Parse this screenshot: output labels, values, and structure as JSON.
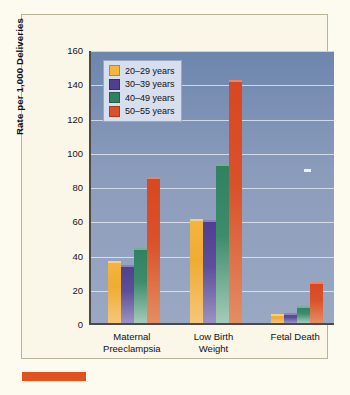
{
  "chart_data": {
    "type": "bar",
    "title": "",
    "xlabel": "",
    "ylabel": "Rate per 1,000 Deliveries",
    "ylim": [
      0,
      160
    ],
    "yticks": [
      0,
      20,
      40,
      60,
      80,
      100,
      120,
      140,
      160
    ],
    "grid": true,
    "legend_position": "top-left",
    "categories": [
      "Maternal Preeclampsia",
      "Low Birth Weight",
      "Fetal Death"
    ],
    "category_lines": [
      [
        "Maternal",
        "Preeclampsia"
      ],
      [
        "Low Birth",
        "Weight"
      ],
      [
        "Fetal Death",
        ""
      ]
    ],
    "series": [
      {
        "name": "20–29 years",
        "color": "#f3b63f",
        "values": [
          36,
          61,
          5
        ]
      },
      {
        "name": "30–39 years",
        "color": "#4e3f90",
        "values": [
          34,
          60,
          6
        ]
      },
      {
        "name": "40–49 years",
        "color": "#2f8162",
        "values": [
          44,
          93,
          10
        ]
      },
      {
        "name": "50–55 years",
        "color": "#d9522a",
        "values": [
          85,
          142,
          24
        ]
      }
    ]
  },
  "figure": {
    "plot_background": "#8b9cbb",
    "page_background": "#fdfaf0",
    "card_background": "#faf6e8",
    "caption_rule_color": "#e2521f"
  }
}
